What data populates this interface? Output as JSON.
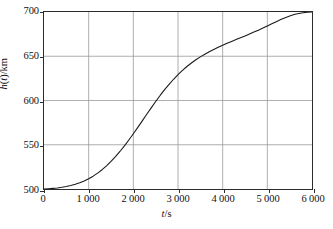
{
  "chart_data": {
    "type": "line",
    "title": "",
    "subtitle": "",
    "xlabel": "t/s",
    "ylabel": "h(t)/km",
    "xlabel_parts": {
      "variable": "t",
      "separator": "/",
      "unit": "s"
    },
    "ylabel_parts": {
      "function": "h",
      "argument": "t",
      "separator": "/",
      "unit": "km"
    },
    "xlim": [
      0,
      6000
    ],
    "ylim": [
      500,
      700
    ],
    "xticks": [
      0,
      1000,
      2000,
      3000,
      4000,
      5000,
      6000
    ],
    "xtick_labels": [
      "0",
      "1 000",
      "2 000",
      "3 000",
      "4 000",
      "5 000",
      "6 000"
    ],
    "yticks": [
      500,
      550,
      600,
      650,
      700
    ],
    "ytick_labels": [
      "500",
      "550",
      "600",
      "650",
      "700"
    ],
    "grid": true,
    "grid_color": "#9a9a9a",
    "frame_color": "#2b2b2b",
    "curve_color": "#1a1a1a",
    "background": "#ffffff",
    "legend": null,
    "annotations": [],
    "series": [
      {
        "name": "h(t)",
        "x": [
          0,
          100,
          200,
          300,
          400,
          500,
          600,
          700,
          800,
          900,
          1000,
          1100,
          1200,
          1300,
          1400,
          1500,
          1600,
          1700,
          1800,
          1900,
          2000,
          2100,
          2200,
          2300,
          2400,
          2500,
          2600,
          2700,
          2800,
          2900,
          3000,
          3100,
          3200,
          3300,
          3400,
          3500,
          3600,
          3700,
          3800,
          3900,
          4000,
          4100,
          4200,
          4300,
          4400,
          4500,
          4600,
          4700,
          4800,
          4900,
          5000,
          5100,
          5200,
          5300,
          5400,
          5500,
          5600,
          5700,
          5800,
          5900,
          6000
        ],
        "y": [
          500.0,
          500.3,
          500.7,
          501.2,
          501.9,
          502.8,
          503.9,
          505.3,
          507.0,
          509.1,
          511.6,
          514.5,
          517.9,
          521.8,
          526.2,
          531.1,
          536.5,
          542.4,
          548.7,
          555.4,
          562.4,
          569.6,
          577.0,
          584.4,
          591.7,
          598.8,
          605.7,
          612.2,
          618.3,
          624.0,
          629.2,
          634.0,
          638.4,
          642.4,
          646.0,
          649.3,
          652.3,
          655.1,
          657.7,
          660.1,
          662.4,
          664.6,
          666.7,
          668.8,
          670.9,
          673.0,
          675.1,
          677.3,
          679.5,
          681.8,
          684.2,
          686.6,
          689.0,
          691.4,
          693.6,
          695.5,
          697.1,
          698.3,
          699.2,
          699.7,
          700.0
        ],
        "color": "#1a1a1a",
        "linewidth": 1.1,
        "style": "solid",
        "markers": false
      }
    ],
    "key_points": [
      {
        "x": 0,
        "y": 500,
        "note": "start of curve at origin of data range"
      },
      {
        "x": 2000,
        "y": 550,
        "note": "curve crosses 550 at t = 2 000 s"
      },
      {
        "x": 3000,
        "y": 630,
        "note": "steepest region, near 630 km"
      },
      {
        "x": 4000,
        "y": 662,
        "note": "curve begins flattening"
      },
      {
        "x": 5000,
        "y": 700,
        "note": "curve reaches plateau at 700 km"
      },
      {
        "x": 6000,
        "y": 700,
        "note": "remains flat at 700 km"
      }
    ],
    "shape_description": "Monotonically increasing S-shaped (sigmoid/logistic) curve rising from 500 km at t = 0 s to a plateau of 700 km at about t = 5 000 s."
  }
}
